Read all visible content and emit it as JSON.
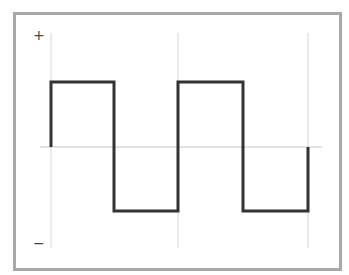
{
  "diagram": {
    "type": "square-wave",
    "y_axis_labels": {
      "top": "+",
      "bottom": "−"
    },
    "colors": {
      "frame": "#a8a8a8",
      "grid": "#d0d0d0",
      "wave": "#333333",
      "axis": "#c8c8c8"
    },
    "wave_points": "51,147 51,82 114,82 114,211 178,211 178,82 243,82 243,211 308,211 308,147",
    "gridlines_x": [
      51,
      178,
      308
    ],
    "baseline_y": 147
  }
}
